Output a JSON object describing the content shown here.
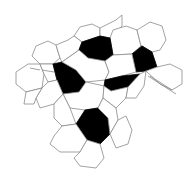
{
  "figure": {
    "width": 195,
    "height": 184,
    "colors": {
      "background": "#ffffff",
      "stroke": "#8a8a8a",
      "dark_fill": "#000000",
      "light_fill": "#ffffff"
    },
    "polygons": [
      {
        "fill": "light",
        "points": "80,27 92,24 100,28 100,36 82,42 74,36"
      },
      {
        "fill": "light",
        "points": "100,28 116,20 122,15 122,26 110,38 100,36"
      },
      {
        "fill": "light",
        "points": "113,30 126,26 137,30 141,46 132,54 113,55 110,38"
      },
      {
        "fill": "light",
        "points": "137,30 150,22 162,26 166,40 160,50 152,52 142,46 141,46"
      },
      {
        "fill": "light",
        "points": "36,46 48,41 56,45 60,58 53,64 40,64 32,56"
      },
      {
        "fill": "light",
        "points": "56,45 68,40 74,36 82,42 79,50 62,62 60,58"
      },
      {
        "fill": "dark",
        "points": "82,42 100,36 110,38 113,55 105,61 88,58 79,50"
      },
      {
        "fill": "dark",
        "points": "132,54 142,46 152,52 157,67 146,71 136,72"
      },
      {
        "fill": "light",
        "points": "16,72 28,64 40,64 44,74 42,88 26,92 16,84"
      },
      {
        "fill": "light",
        "points": "40,64 53,64 57,80 48,82 44,74"
      },
      {
        "fill": "dark",
        "points": "53,64 62,62 76,70 86,82 79,92 63,94 57,80"
      },
      {
        "fill": "light",
        "points": "79,50 88,58 105,61 109,72 105,80 86,82 76,70 62,62"
      },
      {
        "fill": "light",
        "points": "105,61 113,55 132,54 136,72 122,76 105,80 109,72"
      },
      {
        "fill": "dark",
        "points": "105,80 122,76 140,74 128,87 111,91 104,86"
      },
      {
        "fill": "light",
        "points": "157,67 170,64 182,70 182,84 172,90 160,84 146,71"
      },
      {
        "fill": "light",
        "points": "42,88 48,82 57,80 63,94 54,104 40,108 36,98"
      },
      {
        "fill": "light",
        "points": "26,92 42,88 36,98 34,104 24,104"
      },
      {
        "fill": "light",
        "points": "63,94 79,92 86,82 104,86 103,98 98,108 85,110 70,108"
      },
      {
        "fill": "light",
        "points": "104,86 111,91 128,87 126,98 116,108 103,98"
      },
      {
        "fill": "light",
        "points": "128,87 140,74 146,71 144,86 136,98 126,98"
      },
      {
        "fill": "light",
        "points": "54,104 63,94 70,108 76,124 62,126 54,118"
      },
      {
        "fill": "dark",
        "points": "85,110 98,108 108,118 110,134 100,144 87,140 76,124"
      },
      {
        "fill": "light",
        "points": "98,108 103,98 116,108 118,120 110,134 108,118"
      },
      {
        "fill": "light",
        "points": "110,134 118,120 126,116 132,130 128,144 116,148"
      },
      {
        "fill": "light",
        "points": "54,136 62,126 76,124 87,140 80,152 60,152 50,144"
      },
      {
        "fill": "light",
        "points": "80,152 87,140 100,144 104,158 96,168 80,166 74,158"
      }
    ],
    "stray_lines": [
      "148,76 176,94",
      "150,76 172,90",
      "30,68 40,70",
      "42,70 54,72"
    ]
  }
}
